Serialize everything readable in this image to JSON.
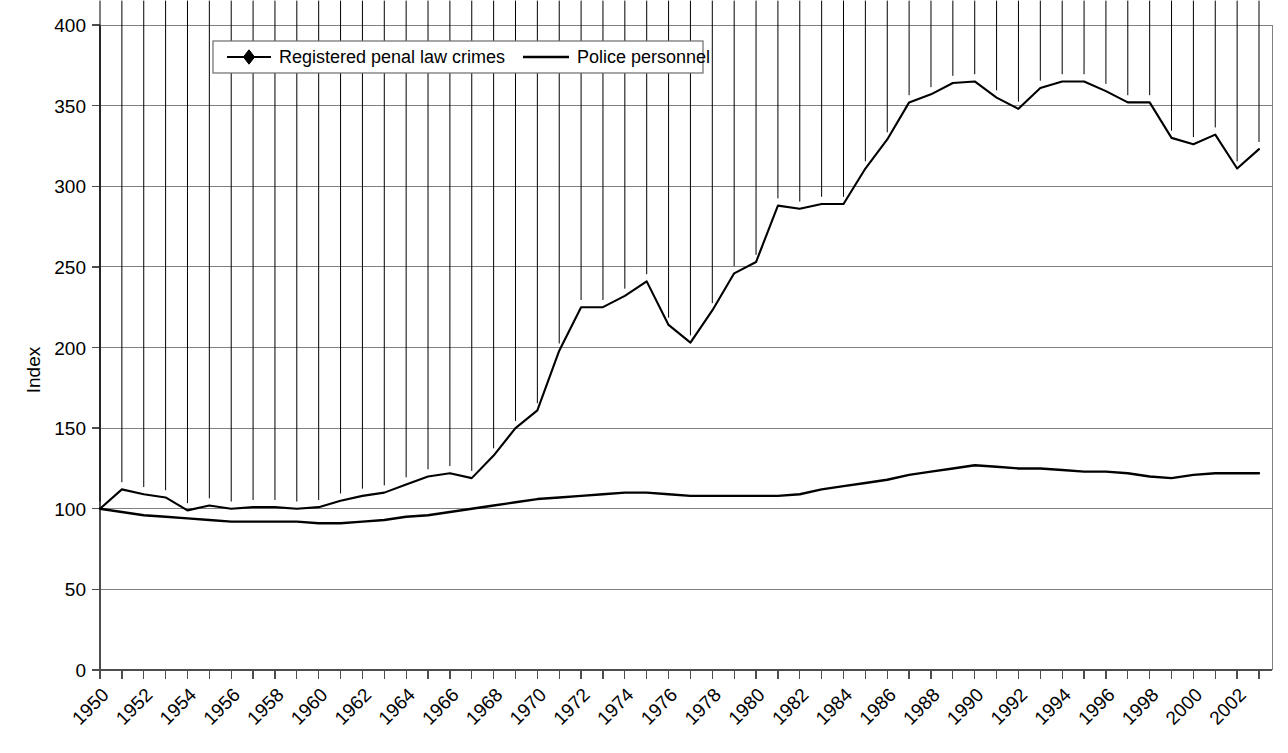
{
  "chart_data": {
    "type": "line",
    "title": "",
    "xlabel": "",
    "ylabel": "Index",
    "ylim": [
      0,
      400
    ],
    "ytick_step": 50,
    "yticks": [
      "0",
      "50",
      "100",
      "150",
      "200",
      "250",
      "300",
      "350",
      "400"
    ],
    "grid": true,
    "legend_position": "top-center",
    "x": [
      1950,
      1951,
      1952,
      1953,
      1954,
      1955,
      1956,
      1957,
      1958,
      1959,
      1960,
      1961,
      1962,
      1963,
      1964,
      1965,
      1966,
      1967,
      1968,
      1969,
      1970,
      1971,
      1972,
      1973,
      1974,
      1975,
      1976,
      1977,
      1978,
      1979,
      1980,
      1981,
      1982,
      1983,
      1984,
      1985,
      1986,
      1987,
      1988,
      1989,
      1990,
      1991,
      1992,
      1993,
      1994,
      1995,
      1996,
      1997,
      1998,
      1999,
      2000,
      2001,
      2002,
      2003
    ],
    "xtick_labels": [
      "1950",
      "1952",
      "1954",
      "1956",
      "1958",
      "1960",
      "1962",
      "1964",
      "1966",
      "1968",
      "1970",
      "1972",
      "1974",
      "1976",
      "1978",
      "1980",
      "1982",
      "1984",
      "1986",
      "1988",
      "1990",
      "1992",
      "1994",
      "1996",
      "1998",
      "2000",
      "2002"
    ],
    "xtick_label_rotation_deg": -45,
    "xlim": [
      1950,
      2003
    ],
    "series": [
      {
        "name": "Registered penal law crimes",
        "marker": "diamond",
        "color": "#000000",
        "values": [
          100,
          112,
          109,
          107,
          99,
          102,
          100,
          101,
          101,
          100,
          101,
          105,
          108,
          110,
          115,
          120,
          122,
          119,
          133,
          150,
          161,
          198,
          225,
          225,
          232,
          241,
          214,
          203,
          223,
          246,
          253,
          288,
          286,
          289,
          289,
          311,
          329,
          352,
          357,
          364,
          365,
          355,
          348,
          361,
          365,
          365,
          359,
          352,
          352,
          330,
          326,
          332,
          311,
          323
        ]
      },
      {
        "name": "Police personnel",
        "marker": "none",
        "color": "#000000",
        "values": [
          100,
          98,
          96,
          95,
          94,
          93,
          92,
          92,
          92,
          92,
          91,
          91,
          92,
          93,
          95,
          96,
          98,
          100,
          102,
          104,
          106,
          107,
          108,
          109,
          110,
          110,
          109,
          108,
          108,
          108,
          108,
          108,
          109,
          112,
          114,
          116,
          118,
          121,
          123,
          125,
          127,
          126,
          125,
          125,
          124,
          123,
          123,
          122,
          120,
          119,
          121,
          122,
          122,
          122
        ]
      }
    ],
    "legend_entries": [
      {
        "label": "Registered penal law crimes",
        "marker": "diamond-line"
      },
      {
        "label": "Police personnel",
        "marker": "line"
      }
    ]
  }
}
